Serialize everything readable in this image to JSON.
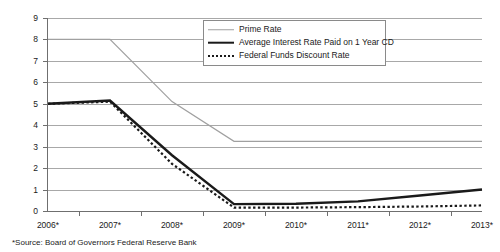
{
  "chart_data": {
    "type": "line",
    "title": "",
    "subtitle": "",
    "xlabel": "",
    "ylabel": "",
    "xlim": [
      2006,
      2013
    ],
    "ylim": [
      0,
      9
    ],
    "ytick_labels": [
      "0",
      "1",
      "2",
      "3",
      "4",
      "5",
      "6",
      "7",
      "8",
      "9"
    ],
    "ytick_values": [
      0,
      1,
      2,
      3,
      4,
      5,
      6,
      7,
      8,
      9
    ],
    "grid": true,
    "legend_position": "top-right",
    "categories": [
      "2006*",
      "2007*",
      "2008*",
      "2009*",
      "2010*",
      "2011*",
      "2012*",
      "2013*"
    ],
    "x": [
      2006,
      2007,
      2008,
      2009,
      2010,
      2011,
      2012,
      2013
    ],
    "series": [
      {
        "name": "Prime Rate",
        "style": "thin-gray-solid",
        "color": "#a0a0a0",
        "values": [
          8.0,
          8.0,
          5.1,
          3.25,
          3.25,
          3.25,
          3.25,
          3.25
        ]
      },
      {
        "name": "Average Interest Rate Paid on 1 Year CD",
        "style": "thick-black-solid",
        "color": "#1a1a1a",
        "values": [
          5.0,
          5.15,
          2.6,
          0.32,
          0.34,
          0.45,
          0.72,
          1.0
        ]
      },
      {
        "name": "Federal Funds Discount Rate",
        "style": "black-dotted",
        "color": "#1a1a1a",
        "values": [
          5.0,
          5.1,
          2.2,
          0.16,
          0.16,
          0.18,
          0.21,
          0.26
        ]
      }
    ],
    "annotations": [
      "*Source: Board of Governors Federal Reserve Bank"
    ]
  },
  "footnote": {
    "text": "*Source: Board of Governors Federal Reserve Bank"
  },
  "legend": {
    "items": [
      {
        "label": "Prime Rate"
      },
      {
        "label": "Average Interest Rate Paid on 1 Year CD"
      },
      {
        "label": "Federal Funds Discount Rate"
      }
    ]
  }
}
